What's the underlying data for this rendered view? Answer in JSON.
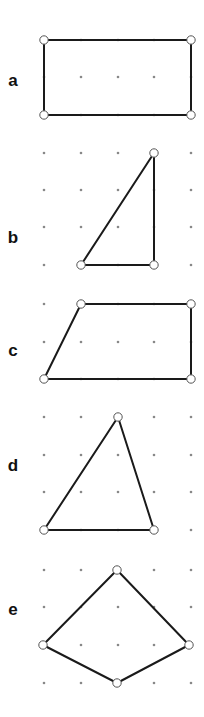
{
  "colors": {
    "line": "#1a1a1a",
    "dot": "#888888",
    "vertex_fill": "#ffffff"
  },
  "grid": {
    "columns_x": [
      44,
      81,
      118,
      154,
      191
    ]
  },
  "figures": [
    {
      "label": "a",
      "label_pos": [
        13,
        80
      ],
      "rows_y": [
        40,
        77,
        115
      ],
      "shape": "rectangle",
      "vertices": [
        [
          44,
          40
        ],
        [
          191,
          40
        ],
        [
          191,
          115
        ],
        [
          44,
          115
        ]
      ]
    },
    {
      "label": "b",
      "label_pos": [
        13,
        237
      ],
      "rows_y": [
        153,
        190,
        227,
        265
      ],
      "shape": "right-triangle",
      "vertices": [
        [
          154,
          153
        ],
        [
          154,
          265
        ],
        [
          81,
          265
        ]
      ]
    },
    {
      "label": "c",
      "label_pos": [
        13,
        350
      ],
      "rows_y": [
        304,
        342,
        379
      ],
      "shape": "trapezoid",
      "vertices": [
        [
          81,
          304
        ],
        [
          191,
          304
        ],
        [
          191,
          379
        ],
        [
          44,
          379
        ]
      ]
    },
    {
      "label": "d",
      "label_pos": [
        13,
        465
      ],
      "rows_y": [
        417,
        455,
        492,
        530
      ],
      "shape": "triangle",
      "vertices": [
        [
          118,
          417
        ],
        [
          154,
          530
        ],
        [
          44,
          530
        ]
      ]
    },
    {
      "label": "e",
      "label_pos": [
        13,
        609
      ],
      "rows_y": [
        570,
        607,
        645,
        683
      ],
      "shape": "kite",
      "vertices": [
        [
          117,
          570
        ],
        [
          189,
          645
        ],
        [
          117,
          683
        ],
        [
          43,
          645
        ]
      ]
    }
  ]
}
